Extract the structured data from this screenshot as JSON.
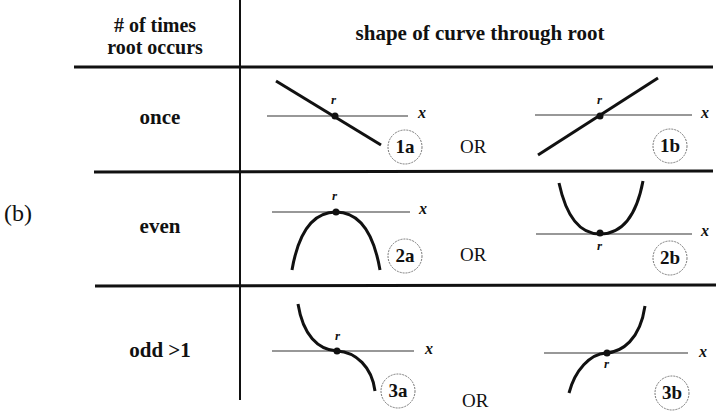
{
  "panel_label": "(b)",
  "table": {
    "header": {
      "col1": "# of times\nroot occurs",
      "col1_line1": "# of times",
      "col1_line2": "root occurs",
      "col2": "shape of curve through root"
    },
    "rows": [
      {
        "label": "once",
        "separator": "OR",
        "diagrams": [
          {
            "id": "1a",
            "shape": "line-decreasing",
            "root_label": "r",
            "axis_label": "x"
          },
          {
            "id": "1b",
            "shape": "line-increasing",
            "root_label": "r",
            "axis_label": "x"
          }
        ]
      },
      {
        "label": "even",
        "separator": "OR",
        "diagrams": [
          {
            "id": "2a",
            "shape": "parabola-down-touching",
            "root_label": "r",
            "axis_label": "x"
          },
          {
            "id": "2b",
            "shape": "parabola-up-touching",
            "root_label": "r",
            "axis_label": "x"
          }
        ]
      },
      {
        "label": "odd >1",
        "separator": "OR",
        "diagrams": [
          {
            "id": "3a",
            "shape": "cubic-decreasing-inflection",
            "root_label": "r",
            "axis_label": "x"
          },
          {
            "id": "3b",
            "shape": "cubic-increasing-inflection",
            "root_label": "r",
            "axis_label": "x"
          }
        ]
      }
    ]
  },
  "colors": {
    "ink": "#111111",
    "axis": "#333333",
    "background": "#ffffff"
  }
}
